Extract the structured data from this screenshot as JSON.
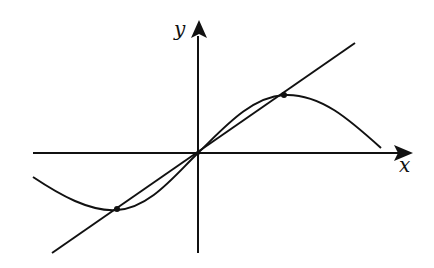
{
  "diagram": {
    "axes": {
      "x_label": "x",
      "y_label": "y"
    },
    "elements": [
      {
        "type": "curve",
        "name": "sine-like curve",
        "passes_through_origin": true,
        "local_min_side": "left",
        "local_max_side": "right"
      },
      {
        "type": "line",
        "name": "straight line through origin",
        "slope": "positive"
      },
      {
        "type": "points",
        "name": "intersection points",
        "count": 3,
        "locations": [
          "third quadrant",
          "origin",
          "first quadrant"
        ]
      }
    ],
    "colors": {
      "stroke": "#111111",
      "background": "#ffffff"
    }
  }
}
